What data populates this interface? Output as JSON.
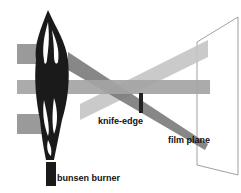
{
  "diagram": {
    "labels": {
      "knife_edge": "knife-edge",
      "film_plane": "film plane",
      "bunsen_burner": "bunsen burner"
    },
    "colors": {
      "beam_light": "#b8b8b8",
      "beam_mid": "#9a9a9a",
      "beam_dark": "#6e6e6e",
      "flame": "#1a1a1a",
      "film_plane_line": "#888888"
    }
  }
}
